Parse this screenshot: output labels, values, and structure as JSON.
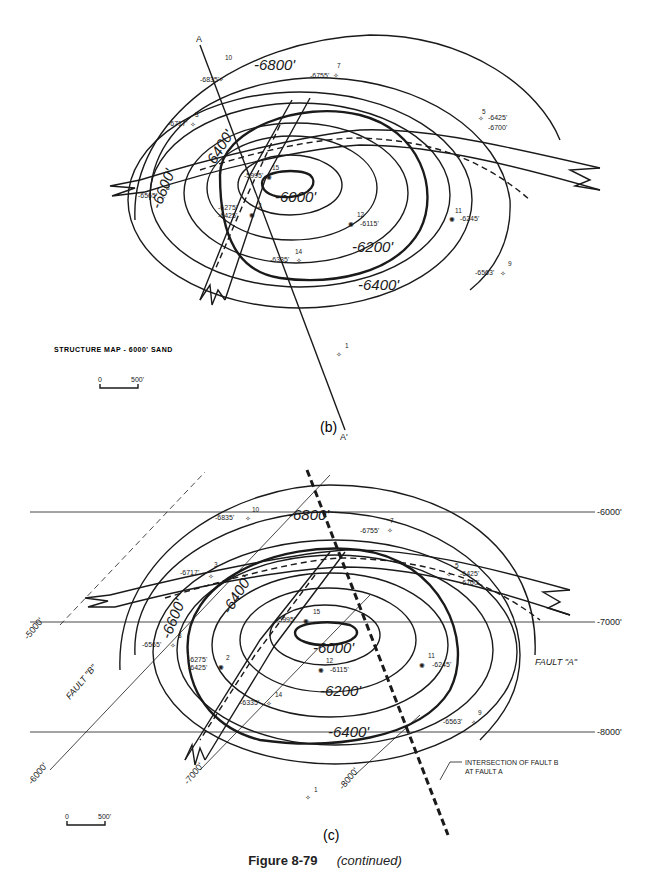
{
  "figure": {
    "caption_number": "Figure 8-79",
    "caption_note": "(continued)"
  },
  "panel_b": {
    "label": "(b)",
    "title": "STRUCTURE MAP - 6000' SAND",
    "scale": {
      "start": "0",
      "end": "500'"
    },
    "section_line": {
      "start": "A",
      "end": "A'"
    },
    "contours": [
      "-6000'",
      "-6200'",
      "-6400'",
      "-6600'",
      "-6800'",
      "6400'"
    ],
    "wells": [
      {
        "num": "10",
        "depth": "-6835'"
      },
      {
        "num": "7",
        "depth": "-6755'"
      },
      {
        "num": "3",
        "depth": "-6717'"
      },
      {
        "num": "5",
        "depth": "-6425'",
        "depth2": "-6700'"
      },
      {
        "num": "15",
        "depth": "-5995'"
      },
      {
        "num": "8",
        "depth": "-6565'"
      },
      {
        "num": "2",
        "depth": "-6275'",
        "depth2": "-6425'"
      },
      {
        "num": "12",
        "depth": "-6115'"
      },
      {
        "num": "11",
        "depth": "-6245'"
      },
      {
        "num": "14",
        "depth": "-6335'"
      },
      {
        "num": "9",
        "depth": "-6563'"
      },
      {
        "num": "1",
        "depth": ""
      }
    ]
  },
  "panel_c": {
    "label": "(c)",
    "scale": {
      "start": "0",
      "end": "500'"
    },
    "horizontal_contours": [
      "-6000'",
      "-7000'",
      "-8000'"
    ],
    "diagonal_contours": [
      "-5000'",
      "-6000'",
      "-7000'",
      "-8000'"
    ],
    "contours": [
      "-6000'",
      "-6200'",
      "-6400'",
      "-6600'",
      "-6800'",
      "-6400'"
    ],
    "fault_labels": [
      "FAULT \"B\"",
      "FAULT \"A\""
    ],
    "annotation": [
      "INTERSECTION OF FAULT B",
      "AT FAULT A"
    ],
    "wells": [
      {
        "num": "10",
        "depth": "-6835'"
      },
      {
        "num": "7",
        "depth": "-6755'"
      },
      {
        "num": "3",
        "depth": "-6717'"
      },
      {
        "num": "5",
        "depth": "-6425'",
        "depth2": "-6700'"
      },
      {
        "num": "15",
        "depth": "-5995'"
      },
      {
        "num": "8",
        "depth": "-6565'"
      },
      {
        "num": "2",
        "depth": "-6275'",
        "depth2": "-6425'"
      },
      {
        "num": "12",
        "depth": "-6115'"
      },
      {
        "num": "11",
        "depth": "-6245'"
      },
      {
        "num": "14",
        "depth": "-6335'"
      },
      {
        "num": "9",
        "depth": "-6563'"
      },
      {
        "num": "1",
        "depth": ""
      }
    ]
  }
}
